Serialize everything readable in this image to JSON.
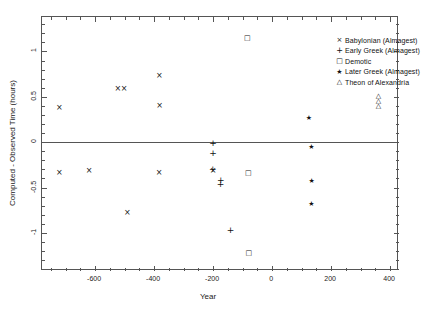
{
  "chart_data": {
    "type": "scatter",
    "title": "",
    "xlabel": "Year",
    "ylabel": "Computed - Observed Time (hours)",
    "xlim": [
      -780,
      430
    ],
    "ylim": [
      -1.42,
      1.38
    ],
    "xticks": [
      -600,
      -400,
      -200,
      0,
      200,
      400
    ],
    "xticklabels": [
      "-600",
      "-400",
      "-200",
      "0",
      "200",
      "400"
    ],
    "yticks": [
      1,
      0.5,
      0,
      -0.5,
      -1
    ],
    "yticklabels": [
      "1",
      "0.5",
      "0",
      "-0.5",
      "-1"
    ],
    "grid": false,
    "zero_line": true,
    "legend_position": "top-right",
    "series": [
      {
        "name": "Babylonian (Almagest)",
        "marker": "x",
        "points": [
          {
            "x": -721,
            "y": 0.38
          },
          {
            "x": -721,
            "y": -0.33
          },
          {
            "x": -620,
            "y": -0.31
          },
          {
            "x": -523,
            "y": 0.59
          },
          {
            "x": -502,
            "y": 0.59
          },
          {
            "x": -491,
            "y": -0.78
          },
          {
            "x": -382,
            "y": 0.73
          },
          {
            "x": -381,
            "y": 0.4
          },
          {
            "x": -383,
            "y": -0.33
          },
          {
            "x": -200,
            "y": -0.31
          }
        ]
      },
      {
        "name": "Early Greek (Almagest)",
        "marker": "+",
        "points": [
          {
            "x": -200,
            "y": -0.01
          },
          {
            "x": -200,
            "y": -0.13
          },
          {
            "x": -201,
            "y": -0.3
          },
          {
            "x": -174,
            "y": -0.42
          },
          {
            "x": -175,
            "y": -0.47
          },
          {
            "x": -141,
            "y": -0.97
          }
        ]
      },
      {
        "name": "Demotic",
        "marker": "square",
        "points": [
          {
            "x": -84,
            "y": 1.15
          },
          {
            "x": -81,
            "y": -0.33
          },
          {
            "x": -79,
            "y": -1.22
          }
        ]
      },
      {
        "name": "Later Greek (Almagest)",
        "marker": "star",
        "points": [
          {
            "x": 125,
            "y": 0.275
          },
          {
            "x": 133,
            "y": -0.05
          },
          {
            "x": 134,
            "y": -0.42
          },
          {
            "x": 133,
            "y": -0.68
          }
        ]
      },
      {
        "name": "Theon of Alexandria",
        "marker": "triangle",
        "points": [
          {
            "x": 360,
            "y": 0.51
          },
          {
            "x": 360,
            "y": 0.455
          },
          {
            "x": 360,
            "y": 0.4
          }
        ]
      }
    ]
  },
  "legend": {
    "entries": [
      {
        "marker": "x",
        "label": "Babylonian (Almagest)"
      },
      {
        "marker": "plus",
        "label": "Early Greek (Almagest)"
      },
      {
        "marker": "square",
        "label": "Demotic"
      },
      {
        "marker": "star",
        "label": "Later Greek (Almagest)"
      },
      {
        "marker": "triangle",
        "label": "Theon of Alexandria"
      }
    ]
  },
  "colors": {
    "axis": "#555555",
    "marker": "#111111",
    "background": "#ffffff"
  }
}
